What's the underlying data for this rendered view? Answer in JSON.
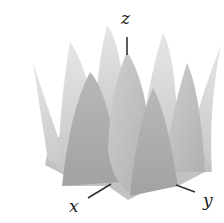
{
  "figure": {
    "type": "3d-surface-plot",
    "colors": {
      "background": "#ffffff",
      "surface_light": "#d9d9d9",
      "surface_mid": "#bdbdbd",
      "surface_dark": "#a6a6a6",
      "axis": "#333333"
    },
    "axes": {
      "x": {
        "label": "x"
      },
      "y": {
        "label": "y"
      },
      "z": {
        "label": "z"
      }
    },
    "peaks": [
      {
        "name": "back-far-left",
        "tip": [
          33,
          62
        ],
        "base": [
          [
            45,
            150
          ],
          [
            70,
            175
          ]
        ],
        "shade": "surface_light"
      },
      {
        "name": "back-left",
        "tip": [
          70,
          42
        ],
        "base": [
          [
            58,
            170
          ],
          [
            105,
            150
          ]
        ],
        "shade": "surface_light"
      },
      {
        "name": "back-center",
        "tip": [
          107,
          25
        ],
        "base": [
          [
            95,
            130
          ],
          [
            128,
            118
          ]
        ],
        "shade": "surface_light"
      },
      {
        "name": "back-right",
        "tip": [
          163,
          33
        ],
        "base": [
          [
            140,
            150
          ],
          [
            178,
            165
          ]
        ],
        "shade": "surface_light"
      },
      {
        "name": "far-right",
        "tip": [
          221,
          45
        ],
        "base": [
          [
            193,
            130
          ],
          [
            212,
            172
          ]
        ],
        "shade": "surface_light"
      },
      {
        "name": "mid-left",
        "tip": [
          90,
          72
        ],
        "base": [
          [
            62,
            185
          ],
          [
            122,
            182
          ]
        ],
        "shade": "surface_dark"
      },
      {
        "name": "center",
        "tip": [
          127,
          52
        ],
        "base": [
          [
            108,
            186
          ],
          [
            152,
            188
          ]
        ],
        "shade": "surface_mid"
      },
      {
        "name": "mid-right",
        "tip": [
          187,
          63
        ],
        "base": [
          [
            163,
            170
          ],
          [
            205,
            172
          ]
        ],
        "shade": "surface_mid"
      },
      {
        "name": "front-right",
        "tip": [
          153,
          88
        ],
        "base": [
          [
            130,
            196
          ],
          [
            178,
            186
          ]
        ],
        "shade": "surface_dark"
      }
    ]
  }
}
